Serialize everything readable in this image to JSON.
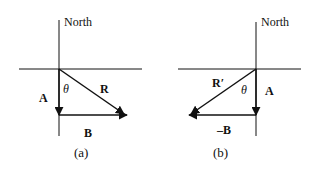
{
  "diagram": {
    "panels": [
      {
        "id": "a",
        "caption": "(a)",
        "axis_label": "North",
        "angle_label": "θ",
        "vectors": [
          {
            "name": "A",
            "label": "A",
            "direction": "south"
          },
          {
            "name": "B",
            "label": "B",
            "direction": "east"
          },
          {
            "name": "R",
            "label": "R",
            "direction": "southeast",
            "note": "resultant R = A + B"
          }
        ]
      },
      {
        "id": "b",
        "caption": "(b)",
        "axis_label": "North",
        "angle_label": "θ",
        "vectors": [
          {
            "name": "A",
            "label": "A",
            "direction": "south"
          },
          {
            "name": "-B",
            "label": "–B",
            "direction": "west"
          },
          {
            "name": "R'",
            "label": "R′",
            "direction": "southwest",
            "note": "resultant R′ = A − B"
          }
        ]
      }
    ],
    "colors": {
      "line": "#111111",
      "background": "#ffffff"
    }
  }
}
